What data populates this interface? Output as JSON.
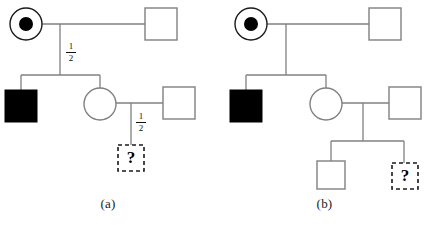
{
  "figure": {
    "type": "pedigree-chart-pair",
    "background_color": "#ffffff",
    "line_color": "#808080",
    "affected_fill_color": "#000000",
    "carrier_dot_color": "#000000",
    "unknown_border_color": "#1a1a1a"
  },
  "panels": [
    {
      "id": "a",
      "caption": "(a)",
      "generations": 3,
      "probability_labels": [
        {
          "id": "prob-a-1",
          "numerator": "1",
          "denominator": "2",
          "on": "generation-1-to-2-descent"
        },
        {
          "id": "prob-a-2",
          "numerator": "1",
          "denominator": "2",
          "on": "generation-2-to-3-descent"
        }
      ],
      "individuals": [
        {
          "id": "a-I-1",
          "sex": "female",
          "status": "carrier",
          "symbol": "circle-with-dot"
        },
        {
          "id": "a-I-2",
          "sex": "male",
          "status": "unaffected",
          "symbol": "open-square"
        },
        {
          "id": "a-II-1",
          "sex": "male",
          "status": "affected",
          "symbol": "filled-square"
        },
        {
          "id": "a-II-2",
          "sex": "female",
          "status": "unaffected",
          "symbol": "open-circle"
        },
        {
          "id": "a-II-3",
          "sex": "male",
          "status": "unaffected",
          "symbol": "open-square"
        },
        {
          "id": "a-III-1",
          "sex": "unknown",
          "status": "unknown",
          "symbol": "dashed-square-question",
          "label": "?"
        }
      ]
    },
    {
      "id": "b",
      "caption": "(b)",
      "generations": 3,
      "probability_labels": [],
      "individuals": [
        {
          "id": "b-I-1",
          "sex": "female",
          "status": "carrier",
          "symbol": "circle-with-dot"
        },
        {
          "id": "b-I-2",
          "sex": "male",
          "status": "unaffected",
          "symbol": "open-square"
        },
        {
          "id": "b-II-1",
          "sex": "male",
          "status": "affected",
          "symbol": "filled-square"
        },
        {
          "id": "b-II-2",
          "sex": "female",
          "status": "unaffected",
          "symbol": "open-circle"
        },
        {
          "id": "b-II-3",
          "sex": "male",
          "status": "unaffected",
          "symbol": "open-square"
        },
        {
          "id": "b-III-1",
          "sex": "male",
          "status": "unaffected",
          "symbol": "open-square"
        },
        {
          "id": "b-III-2",
          "sex": "unknown",
          "status": "unknown",
          "symbol": "dashed-square-question",
          "label": "?"
        }
      ]
    }
  ],
  "labels": {
    "caption_a": "(a)",
    "caption_b": "(b)",
    "question_mark": "?",
    "half_numerator": "1",
    "half_denominator": "2"
  }
}
